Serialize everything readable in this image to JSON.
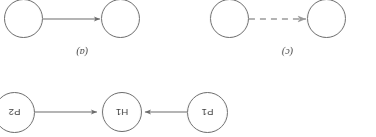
{
  "figure": {
    "orientation_degrees": 180,
    "background_color": "#ffffff",
    "stroke_color": "#6b6b6b",
    "dashed_stroke_color": "#9a9a9a",
    "text_color": "#404040",
    "caption_color": "#3d3d3d",
    "panels": [
      {
        "caption": "(a)",
        "nodes": [
          {
            "id": "node-a-left",
            "label": ""
          },
          {
            "id": "node-a-right",
            "label": ""
          }
        ],
        "edges": [
          {
            "from": "node-a-right",
            "to": "node-a-left",
            "style": "solid",
            "arrow": "single"
          }
        ]
      },
      {
        "caption": "(c)",
        "nodes": [
          {
            "id": "node-c-left",
            "label": ""
          },
          {
            "id": "node-c-right",
            "label": ""
          }
        ],
        "edges": [
          {
            "from": "node-c-right",
            "to": "node-c-left",
            "style": "dashed",
            "arrow": "single"
          }
        ]
      },
      {
        "caption": "",
        "nodes": [
          {
            "id": "node-p1",
            "label": "P1"
          },
          {
            "id": "node-h1",
            "label": "H1"
          },
          {
            "id": "node-p2",
            "label": "P2"
          }
        ],
        "edges": [
          {
            "from": "node-p1",
            "to": "node-h1",
            "style": "solid",
            "arrow": "single"
          },
          {
            "from": "node-p2",
            "to": "node-h1",
            "style": "solid",
            "arrow": "single"
          }
        ]
      }
    ]
  },
  "nodes": {
    "p1": {
      "label": "P1"
    },
    "h1": {
      "label": "H1"
    },
    "p2": {
      "label": "P2"
    },
    "a_left": {
      "label": ""
    },
    "a_right": {
      "label": ""
    },
    "c_left": {
      "label": ""
    },
    "c_right": {
      "label": ""
    }
  },
  "captions": {
    "panel_a": "(a)",
    "panel_c": "(c)"
  }
}
